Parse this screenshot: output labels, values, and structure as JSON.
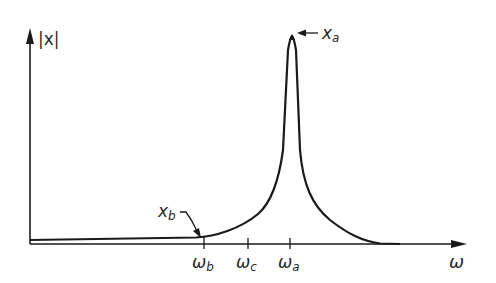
{
  "diagram": {
    "type": "resonance-response-curve",
    "axes": {
      "y_label": "|x|",
      "x_label": "ω"
    },
    "ticks": [
      {
        "id": "omega_b",
        "base": "ω",
        "sub": "b"
      },
      {
        "id": "omega_c",
        "base": "ω",
        "sub": "c"
      },
      {
        "id": "omega_a",
        "base": "ω",
        "sub": "a"
      }
    ],
    "annotations": [
      {
        "id": "x_a",
        "base": "x",
        "sub": "a",
        "target": "peak of curve at ω_a"
      },
      {
        "id": "x_b",
        "base": "x",
        "sub": "b",
        "target": "curve at ω_b"
      }
    ],
    "colors": {
      "line": "#1a1a1a",
      "text": "#2a2a2a",
      "background": "#ffffff"
    }
  }
}
